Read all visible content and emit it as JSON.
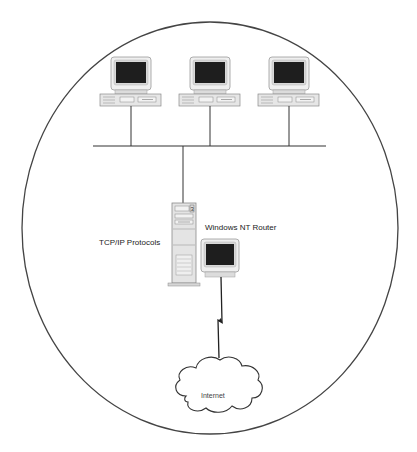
{
  "diagram": {
    "boundary": {
      "shape": "ellipse",
      "cx": 210,
      "cy": 228,
      "rx": 188,
      "ry": 206,
      "stroke": "#444444"
    },
    "workstations": [
      {
        "id": "workstation-1",
        "label": "",
        "x": 100,
        "y": 57
      },
      {
        "id": "workstation-2",
        "label": "",
        "x": 179,
        "y": 57
      },
      {
        "id": "workstation-3",
        "label": "",
        "x": 258,
        "y": 57
      }
    ],
    "bus": {
      "y": 146,
      "x1": 93,
      "x2": 326
    },
    "server": {
      "id": "router-server",
      "label": "Windows NT Router",
      "protocol_label": "TCP/IP Protocols"
    },
    "router_monitor": {
      "id": "router-monitor"
    },
    "link": {
      "type": "lightning-bolt",
      "from": "router-monitor",
      "to": "internet-cloud"
    },
    "internet": {
      "id": "internet-cloud",
      "label": "Internet"
    },
    "colors": {
      "line": "#333333",
      "screen": "#1e1e1e",
      "case": "#e6e6e6",
      "case_stroke": "#8a8a8a",
      "bezel": "#eeeeee"
    }
  },
  "labels": {
    "tcpip": "TCP/IP Protocols",
    "router": "Windows NT Router",
    "internet": "Internet"
  }
}
